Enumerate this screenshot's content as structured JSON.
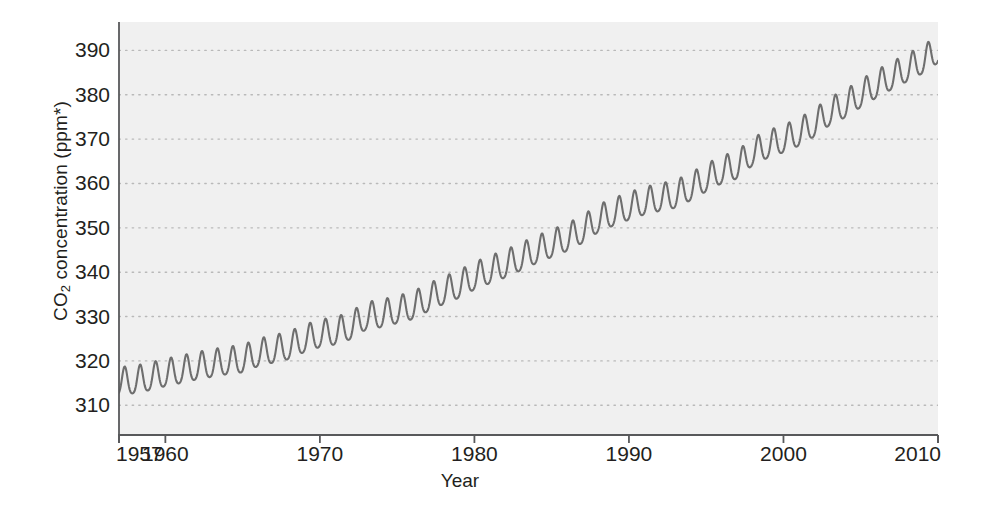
{
  "chart_data": {
    "type": "line",
    "title": "",
    "xlabel": "Year",
    "ylabel": "CO2 concentration (ppm*)",
    "ylabel_parts": {
      "prefix": "CO",
      "sub": "2",
      "suffix": " concentration (ppm*)"
    },
    "xlim": [
      1957,
      2010
    ],
    "ylim": [
      303.3,
      396.4
    ],
    "xticks": [
      1957,
      1960,
      1970,
      1980,
      1990,
      2000,
      2010
    ],
    "xtick_labels": [
      "1957",
      "1960",
      "1970",
      "1980",
      "1990",
      "2000",
      "2010"
    ],
    "yticks": [
      310,
      320,
      330,
      340,
      350,
      360,
      370,
      380,
      390
    ],
    "ytick_labels": [
      "310",
      "320",
      "330",
      "340",
      "350",
      "360",
      "370",
      "380",
      "390"
    ],
    "grid": "horizontal dotted",
    "legend": "none",
    "series": [
      {
        "name": "Mauna Loa atmospheric CO2 (Keeling Curve)",
        "color": "#6e6e6e",
        "description": "Monthly mean CO2 concentration with seasonal oscillation superimposed on a rising trend",
        "seasonal_amplitude_ppm": 3.1,
        "seasonal_peak_month": "May",
        "seasonal_trough_month": "September",
        "annual_means": [
          {
            "year": 1957,
            "value": 315.0
          },
          {
            "year": 1958,
            "value": 315.3
          },
          {
            "year": 1959,
            "value": 316.0
          },
          {
            "year": 1960,
            "value": 316.9
          },
          {
            "year": 1961,
            "value": 317.6
          },
          {
            "year": 1962,
            "value": 318.4
          },
          {
            "year": 1963,
            "value": 319.0
          },
          {
            "year": 1964,
            "value": 319.6
          },
          {
            "year": 1965,
            "value": 320.0
          },
          {
            "year": 1966,
            "value": 321.4
          },
          {
            "year": 1967,
            "value": 322.2
          },
          {
            "year": 1968,
            "value": 323.0
          },
          {
            "year": 1969,
            "value": 324.6
          },
          {
            "year": 1970,
            "value": 325.7
          },
          {
            "year": 1971,
            "value": 326.3
          },
          {
            "year": 1972,
            "value": 327.5
          },
          {
            "year": 1973,
            "value": 329.7
          },
          {
            "year": 1974,
            "value": 330.2
          },
          {
            "year": 1975,
            "value": 331.1
          },
          {
            "year": 1976,
            "value": 332.0
          },
          {
            "year": 1977,
            "value": 333.8
          },
          {
            "year": 1978,
            "value": 335.4
          },
          {
            "year": 1979,
            "value": 336.8
          },
          {
            "year": 1980,
            "value": 338.7
          },
          {
            "year": 1981,
            "value": 340.1
          },
          {
            "year": 1982,
            "value": 341.4
          },
          {
            "year": 1983,
            "value": 343.0
          },
          {
            "year": 1984,
            "value": 344.6
          },
          {
            "year": 1985,
            "value": 346.0
          },
          {
            "year": 1986,
            "value": 347.4
          },
          {
            "year": 1987,
            "value": 349.2
          },
          {
            "year": 1988,
            "value": 351.6
          },
          {
            "year": 1989,
            "value": 353.1
          },
          {
            "year": 1990,
            "value": 354.4
          },
          {
            "year": 1991,
            "value": 355.6
          },
          {
            "year": 1992,
            "value": 356.4
          },
          {
            "year": 1993,
            "value": 357.1
          },
          {
            "year": 1994,
            "value": 358.8
          },
          {
            "year": 1995,
            "value": 360.8
          },
          {
            "year": 1996,
            "value": 362.6
          },
          {
            "year": 1997,
            "value": 363.7
          },
          {
            "year": 1998,
            "value": 366.7
          },
          {
            "year": 1999,
            "value": 368.4
          },
          {
            "year": 2000,
            "value": 369.6
          },
          {
            "year": 2001,
            "value": 371.1
          },
          {
            "year": 2002,
            "value": 373.2
          },
          {
            "year": 2003,
            "value": 375.8
          },
          {
            "year": 2004,
            "value": 377.5
          },
          {
            "year": 2005,
            "value": 379.8
          },
          {
            "year": 2006,
            "value": 381.9
          },
          {
            "year": 2007,
            "value": 383.8
          },
          {
            "year": 2008,
            "value": 385.6
          },
          {
            "year": 2009,
            "value": 387.4
          },
          {
            "year": 2010,
            "value": 389.8
          }
        ]
      }
    ]
  },
  "style": {
    "panel_background": "#f0f0f0",
    "grid_color": "#b9b9b9",
    "line_color": "#6e6e6e",
    "axis_color": "#58595b",
    "text_color": "#231f20"
  }
}
